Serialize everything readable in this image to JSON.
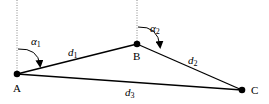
{
  "points": {
    "A": {
      "label": "A",
      "x": 17,
      "y": 74
    },
    "B": {
      "label": "B",
      "x": 137,
      "y": 44
    },
    "C": {
      "label": "C",
      "x": 242,
      "y": 90
    }
  },
  "segments": {
    "d1": {
      "base": "d",
      "sub": "1"
    },
    "d2": {
      "base": "d",
      "sub": "2"
    },
    "d3": {
      "base": "d",
      "sub": "3"
    }
  },
  "angles": {
    "alpha1": {
      "base": "α",
      "sub": "1"
    },
    "alpha2": {
      "base": "α",
      "sub": "2"
    }
  }
}
